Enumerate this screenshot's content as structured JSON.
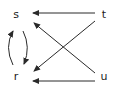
{
  "diagram": {
    "type": "directed-graph",
    "colors": {
      "stroke": "#2a2a2a",
      "text": "#222222",
      "background": "#ffffff"
    },
    "nodes": [
      {
        "id": "s",
        "label": "s",
        "x": 16,
        "y": 14
      },
      {
        "id": "t",
        "label": "t",
        "x": 104,
        "y": 14
      },
      {
        "id": "r",
        "label": "r",
        "x": 16,
        "y": 76
      },
      {
        "id": "u",
        "label": "u",
        "x": 104,
        "y": 76
      }
    ],
    "edges": [
      {
        "from": "t",
        "to": "s",
        "shape": "straight"
      },
      {
        "from": "u",
        "to": "r",
        "shape": "straight"
      },
      {
        "from": "t",
        "to": "r",
        "shape": "straight"
      },
      {
        "from": "u",
        "to": "s",
        "shape": "straight"
      },
      {
        "from": "r",
        "to": "s",
        "shape": "curved-left"
      },
      {
        "from": "s",
        "to": "r",
        "shape": "curved-right"
      }
    ]
  }
}
